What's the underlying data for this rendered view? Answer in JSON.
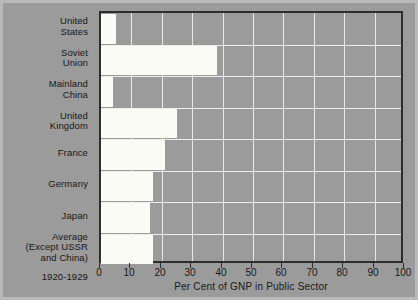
{
  "chart_data": {
    "type": "bar",
    "orientation": "horizontal",
    "title": "",
    "subtitle": "",
    "xlabel": "Per Cent of GNP in Public Sector",
    "ylabel": "",
    "xlim": [
      0,
      100
    ],
    "xticks": [
      0,
      10,
      20,
      30,
      40,
      50,
      60,
      70,
      80,
      90,
      100
    ],
    "xticklabels": [
      "0",
      "10",
      "20",
      "30",
      "40",
      "50",
      "60",
      "70",
      "80",
      "90",
      "100"
    ],
    "grid": true,
    "legend": null,
    "categories": [
      "United States",
      "Soviet Union",
      "Mainland China",
      "United Kingdom",
      "France",
      "Germany",
      "Japan",
      "Average (Except USSR and China)"
    ],
    "category_lines": [
      [
        "United",
        "States"
      ],
      [
        "Soviet",
        "Union"
      ],
      [
        "Mainland",
        "China"
      ],
      [
        "United",
        "Kingdom"
      ],
      [
        "France"
      ],
      [
        "Germany"
      ],
      [
        "Japan"
      ],
      [
        "Average",
        "(Except USSR",
        "and China)"
      ]
    ],
    "values": [
      5,
      38,
      4,
      25,
      21,
      17,
      16,
      17
    ],
    "annotation": "1920-1929",
    "colors": {
      "background": "#9b9b9b",
      "plot_background": "#9b9b9b",
      "bar": "#fbfbf6",
      "gridline": "#e8e8e8",
      "axis": "#2d2d2d",
      "text": "#181818",
      "frame": "#b9b9b9"
    }
  }
}
